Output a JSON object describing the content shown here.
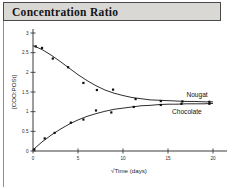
{
  "figure": {
    "title": "Concentration Ratio"
  },
  "chart_data": {
    "type": "scatter",
    "title": "Concentration Ratio",
    "xlabel": "√Time (days)",
    "ylabel": "[COO:POSt]",
    "xlim": [
      0,
      20
    ],
    "ylim": [
      0,
      3
    ],
    "xticks": [
      0,
      5,
      10,
      15,
      20
    ],
    "xtick_labels": [
      "0",
      "5",
      "10",
      "15",
      "20"
    ],
    "yticks": [
      0,
      0.5,
      1,
      1.5,
      2,
      2.5,
      3
    ],
    "ytick_labels": [
      "0",
      "0.5",
      "1",
      "1.5",
      "2",
      "2.5",
      "3"
    ],
    "grid": false,
    "legend_position": "right-inline",
    "series": [
      {
        "name": "Nougat",
        "marker": "square",
        "label_x": 16.6,
        "label_y": 1.42,
        "points": [
          {
            "x": 0.3,
            "y": 2.66
          },
          {
            "x": 1.0,
            "y": 2.62
          },
          {
            "x": 2.2,
            "y": 2.35
          },
          {
            "x": 3.9,
            "y": 2.13
          },
          {
            "x": 5.6,
            "y": 1.73
          },
          {
            "x": 7.1,
            "y": 1.55
          },
          {
            "x": 8.9,
            "y": 1.56
          },
          {
            "x": 11.4,
            "y": 1.32
          },
          {
            "x": 14.2,
            "y": 1.27
          },
          {
            "x": 16.6,
            "y": 1.26
          },
          {
            "x": 19.6,
            "y": 1.25
          }
        ],
        "fit": [
          {
            "x": 0.0,
            "y": 2.68
          },
          {
            "x": 1.0,
            "y": 2.58
          },
          {
            "x": 2.0,
            "y": 2.44
          },
          {
            "x": 3.0,
            "y": 2.28
          },
          {
            "x": 4.0,
            "y": 2.11
          },
          {
            "x": 5.0,
            "y": 1.94
          },
          {
            "x": 6.0,
            "y": 1.79
          },
          {
            "x": 7.0,
            "y": 1.66
          },
          {
            "x": 8.0,
            "y": 1.55
          },
          {
            "x": 9.0,
            "y": 1.47
          },
          {
            "x": 10.0,
            "y": 1.41
          },
          {
            "x": 11.0,
            "y": 1.36
          },
          {
            "x": 12.0,
            "y": 1.33
          },
          {
            "x": 13.0,
            "y": 1.3
          },
          {
            "x": 14.0,
            "y": 1.29
          },
          {
            "x": 15.0,
            "y": 1.28
          },
          {
            "x": 16.0,
            "y": 1.27
          },
          {
            "x": 17.0,
            "y": 1.26
          },
          {
            "x": 18.0,
            "y": 1.26
          },
          {
            "x": 19.0,
            "y": 1.25
          },
          {
            "x": 20.0,
            "y": 1.25
          }
        ]
      },
      {
        "name": "Chocolate",
        "marker": "square",
        "label_x": 15.0,
        "label_y": 1.0,
        "points": [
          {
            "x": 0.15,
            "y": 0.04
          },
          {
            "x": 1.3,
            "y": 0.32
          },
          {
            "x": 2.4,
            "y": 0.46
          },
          {
            "x": 4.2,
            "y": 0.72
          },
          {
            "x": 5.6,
            "y": 0.8
          },
          {
            "x": 7.0,
            "y": 1.03
          },
          {
            "x": 8.7,
            "y": 0.98
          },
          {
            "x": 11.2,
            "y": 1.12
          },
          {
            "x": 14.2,
            "y": 1.17
          },
          {
            "x": 16.5,
            "y": 1.2
          },
          {
            "x": 19.6,
            "y": 1.2
          }
        ],
        "fit": [
          {
            "x": 0.0,
            "y": 0.03
          },
          {
            "x": 1.0,
            "y": 0.23
          },
          {
            "x": 2.0,
            "y": 0.4
          },
          {
            "x": 3.0,
            "y": 0.55
          },
          {
            "x": 4.0,
            "y": 0.68
          },
          {
            "x": 5.0,
            "y": 0.79
          },
          {
            "x": 6.0,
            "y": 0.88
          },
          {
            "x": 7.0,
            "y": 0.95
          },
          {
            "x": 8.0,
            "y": 1.01
          },
          {
            "x": 9.0,
            "y": 1.06
          },
          {
            "x": 10.0,
            "y": 1.09
          },
          {
            "x": 11.0,
            "y": 1.12
          },
          {
            "x": 12.0,
            "y": 1.15
          },
          {
            "x": 13.0,
            "y": 1.16
          },
          {
            "x": 14.0,
            "y": 1.18
          },
          {
            "x": 15.0,
            "y": 1.19
          },
          {
            "x": 16.0,
            "y": 1.19
          },
          {
            "x": 17.0,
            "y": 1.2
          },
          {
            "x": 18.0,
            "y": 1.2
          },
          {
            "x": 19.0,
            "y": 1.2
          },
          {
            "x": 20.0,
            "y": 1.21
          }
        ]
      }
    ]
  }
}
